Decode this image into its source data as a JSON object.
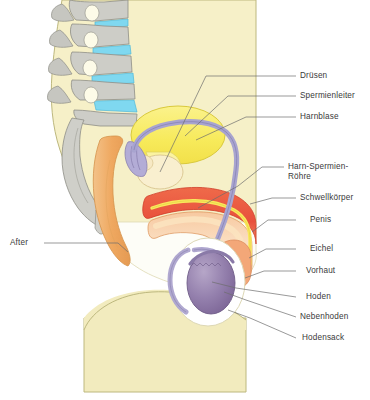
{
  "figure": {
    "background_color": "#ffffff",
    "body_color": "#f6f0c8",
    "body_outline_color": "#b9b477",
    "leader_line_color": "#6d6d6d",
    "label_text_color": "#3a3a3a"
  },
  "labels": {
    "druesen": "Drüsen",
    "spermienleiter": "Spermienleiter",
    "harnblase": "Harnblase",
    "harn_spermien_roehre_l1": "Harn-Spermien-",
    "harn_spermien_roehre_l2": "Röhre",
    "schwellkoerper": "Schwellkörper",
    "penis": "Penis",
    "eichel": "Eichel",
    "vorhaut": "Vorhaut",
    "hoden": "Hoden",
    "nebenhoden": "Nebenhoden",
    "hodensack": "Hodensack",
    "after": "After"
  },
  "anatomy": {
    "vertebrae": {
      "name": "Wirbelkörper",
      "color": "#c9c9c4",
      "outline": "#8e8e86"
    },
    "discs": {
      "name": "Bandscheiben",
      "color": "#7fd8f0",
      "outline": "#4fb8d8"
    },
    "bladder": {
      "name": "Harnblase",
      "color": "#f7ea5a",
      "outline": "#d9c93c"
    },
    "vas_deferens": {
      "name": "Spermienleiter",
      "color": "#a8a4cf",
      "outline": "#7d79ad"
    },
    "prostate_glands": {
      "name": "Drüsen",
      "color": "#f7e9c4",
      "outline": "#d8c48e"
    },
    "corpus_cavernosum": {
      "name": "Schwellkörper",
      "color": "#e8503c",
      "outline": "#d0402c"
    },
    "penis_shaft": {
      "name": "Penis",
      "color": "#f7b98a",
      "outline": "#e09a63"
    },
    "urethra": {
      "name": "Harn-Spermien-Röhre",
      "color": "#f9e85c",
      "outline": "#ddc93c"
    },
    "glans": {
      "name": "Eichel",
      "color": "#f3a778",
      "outline": "#dd8c5c"
    },
    "testis": {
      "name": "Hoden",
      "color": "#8f7aa8",
      "outline": "#6f5c88"
    },
    "epididymis": {
      "name": "Nebenhoden",
      "color": "#b0a8d0",
      "outline": "#8a82ae"
    },
    "scrotum": {
      "name": "Hodensack",
      "color": "#ffffff",
      "outline": "#d7d2b0"
    },
    "rectum": {
      "name": "Enddarm / After",
      "color": "#efa860",
      "outline": "#d4924a"
    },
    "sacrum": {
      "name": "Kreuzbein",
      "color": "#cfcfc9",
      "outline": "#8e8e86"
    }
  }
}
